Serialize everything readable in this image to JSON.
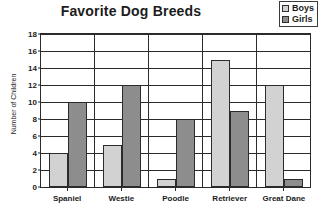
{
  "chart_data": {
    "type": "bar",
    "title": "Favorite Dog Breeds",
    "xlabel": "",
    "ylabel": "Number of Children",
    "categories": [
      "Spaniel",
      "Westie",
      "Poodle",
      "Retriever",
      "Great Dane"
    ],
    "series": [
      {
        "name": "Boys",
        "color": "#d2d2d2",
        "values": [
          4,
          5,
          1,
          15,
          12
        ]
      },
      {
        "name": "Girls",
        "color": "#8d8d8d",
        "values": [
          10,
          12,
          8,
          9,
          1
        ]
      }
    ],
    "ylim": [
      0,
      18
    ],
    "ytick_step": 2,
    "yticks": [
      0,
      2,
      4,
      6,
      8,
      10,
      12,
      14,
      16,
      18
    ],
    "grid": true,
    "legend_position": "top-right"
  },
  "legend": {
    "items": [
      {
        "label": "Boys",
        "swatch": "light-gray-swatch-icon"
      },
      {
        "label": "Girls",
        "swatch": "dark-gray-swatch-icon"
      }
    ]
  },
  "colors": {
    "boys": "#d2d2d2",
    "girls": "#8d8d8d",
    "axis": "#2b2b2b",
    "text": "#1c1c1c",
    "background": "#ffffff"
  }
}
